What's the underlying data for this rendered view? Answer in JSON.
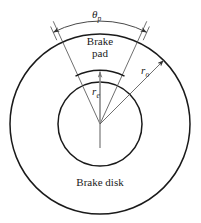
{
  "figure": {
    "width": 201,
    "height": 223,
    "background": "#ffffff",
    "line_color": "#1a1a1a",
    "thin_line_color": "#555555"
  },
  "labels": {
    "brake_pad": "Brake\npad",
    "brake_pad_line1": "Brake",
    "brake_pad_line2": "pad",
    "brake_disk": "Brake disk",
    "theta_symbol": "θ",
    "theta_subscript": "p",
    "r_outer_symbol": "r",
    "r_outer_subscript": "o",
    "r_inner_symbol": "r",
    "r_inner_subscript": "e"
  },
  "geometry": {
    "center_x": 100,
    "center_y": 124,
    "outer_radius": 90,
    "inner_radius": 42,
    "pad_inner_radius": 54,
    "pad_half_angle_deg": 27,
    "dimension_arc_radius": 103,
    "r_o_arrow_angle_deg": 45
  }
}
